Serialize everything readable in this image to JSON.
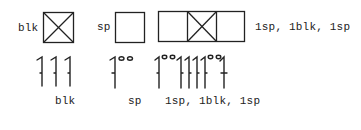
{
  "diagram": {
    "chart_row": {
      "items": [
        {
          "label": "blk",
          "cells": [
            "block"
          ]
        },
        {
          "label": "sp",
          "cells": [
            "space"
          ]
        },
        {
          "label": "1sp, 1blk, 1sp",
          "cells": [
            "space",
            "block",
            "space"
          ]
        }
      ]
    },
    "stitch_row": {
      "items": [
        {
          "label": "blk",
          "symbols": [
            "dc",
            "dc",
            "dc"
          ]
        },
        {
          "label": "sp",
          "symbols": [
            "dc",
            "ch",
            "ch"
          ]
        },
        {
          "label": "1sp, 1blk, 1sp",
          "symbols": [
            "dc",
            "ch",
            "ch",
            "dc",
            "dc",
            "dc",
            "dc",
            "ch",
            "ch",
            "dc"
          ]
        }
      ]
    },
    "colors": {
      "ink": "#222222",
      "background": "#ffffff"
    }
  }
}
